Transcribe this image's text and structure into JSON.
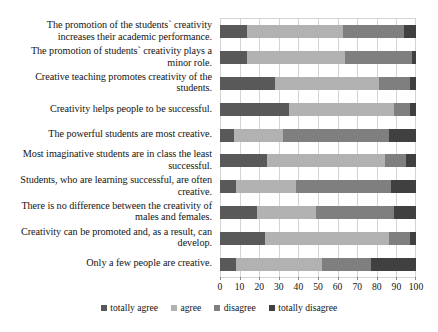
{
  "chart_data": {
    "type": "bar",
    "subtype": "stacked-horizontal-100",
    "title": "",
    "xlabel": "",
    "ylabel": "",
    "xlim": [
      0,
      100
    ],
    "xticks": [
      "0",
      "10",
      "20",
      "30",
      "40",
      "50",
      "60",
      "70",
      "80",
      "90",
      "100"
    ],
    "grid": true,
    "legend_position": "bottom",
    "categories": [
      "The promotion of the students` creativity increases their academic performance.",
      "The promotion of students` creativity plays a minor role.",
      "Creative teaching promotes creativity of the students.",
      "Creativity helps people to be successful.",
      "The powerful students are most creative.",
      "Most imaginative students are in class the least successful.",
      "Students, who are learning successful, are often creative.",
      "There is no difference between the creativity of males and females.",
      "Creativity can be promoted and, as a result, can develop.",
      "Only a few people are creative."
    ],
    "series": [
      {
        "name": "totally agree",
        "color": "#595959",
        "values": [
          14,
          14,
          28,
          35,
          7,
          24,
          8,
          19,
          23,
          8
        ]
      },
      {
        "name": "agree",
        "color": "#b2b2b2",
        "values": [
          49,
          50,
          53,
          54,
          25,
          60,
          31,
          30,
          63,
          44
        ]
      },
      {
        "name": "disagree",
        "color": "#7f7f7f",
        "values": [
          31,
          34,
          16,
          8,
          54,
          11,
          48,
          40,
          11,
          25
        ]
      },
      {
        "name": "totally disagree",
        "color": "#404040",
        "values": [
          6,
          2,
          3,
          3,
          14,
          5,
          13,
          11,
          3,
          23
        ]
      }
    ]
  },
  "legend": {
    "items": [
      {
        "label": "totally agree",
        "color": "#595959"
      },
      {
        "label": "agree",
        "color": "#b2b2b2"
      },
      {
        "label": "disagree",
        "color": "#7f7f7f"
      },
      {
        "label": "totally disagree",
        "color": "#404040"
      }
    ]
  }
}
